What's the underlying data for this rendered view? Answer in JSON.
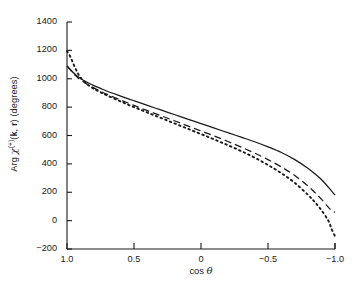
{
  "figure": {
    "background": "#ffffff",
    "ink_color": "#1a1a1a",
    "frame": {
      "left": 67,
      "top": 22,
      "right": 335,
      "bottom": 249
    }
  },
  "axes": {
    "ylabel_parts": {
      "arg": "Arg ",
      "chi": "χ",
      "superscript": "(+)",
      "args_open": "(",
      "k": "k",
      "comma": ", ",
      "r": "r",
      "args_close": ")",
      "units": " (degrees)"
    },
    "ylabel_plain": "Arg χ(+)(k, r) (degrees)",
    "xlabel_prefix": "cos ",
    "xlabel_symbol": "θ",
    "xlabel_plain": "cos θ"
  },
  "chart_data": {
    "type": "line",
    "title": "",
    "xlabel": "cos θ",
    "ylabel": "Arg χ(+)(k, r) (degrees)",
    "xlim": [
      1.0,
      -1.0
    ],
    "ylim": [
      -200,
      1400
    ],
    "x_reversed": true,
    "grid": false,
    "legend": "none",
    "xticks": [
      1.0,
      0.5,
      0,
      -0.5,
      -1.0
    ],
    "xticklabels": [
      "1.0",
      "0.5",
      "0",
      "−0.5",
      "−1.0"
    ],
    "yticks": [
      1400,
      1200,
      1000,
      800,
      600,
      400,
      200,
      0,
      -200
    ],
    "yticklabels": [
      "1400",
      "1200",
      "1000",
      "800",
      "600",
      "400",
      "200",
      "0",
      "−200"
    ],
    "tick_direction": "in",
    "x": [
      1.0,
      0.975,
      0.95,
      0.925,
      0.9,
      0.85,
      0.8,
      0.75,
      0.7,
      0.6,
      0.5,
      0.4,
      0.3,
      0.2,
      0.1,
      0.0,
      -0.1,
      -0.2,
      -0.3,
      -0.4,
      -0.5,
      -0.6,
      -0.7,
      -0.8,
      -0.85,
      -0.9,
      -0.95,
      -0.975,
      -1.0
    ],
    "series": [
      {
        "name": "solid",
        "style": "solid",
        "color": "#1a1a1a",
        "values": [
          1090,
          1065,
          1040,
          1020,
          1002,
          975,
          952,
          932,
          912,
          878,
          845,
          812,
          780,
          748,
          716,
          684,
          652,
          620,
          588,
          556,
          520,
          480,
          430,
          368,
          330,
          288,
          236,
          208,
          180
        ]
      },
      {
        "name": "dashed",
        "style": "dashed",
        "color": "#1a1a1a",
        "values": [
          1090,
          1062,
          1035,
          1012,
          992,
          962,
          936,
          912,
          890,
          850,
          812,
          775,
          740,
          704,
          668,
          632,
          596,
          558,
          518,
          476,
          430,
          378,
          318,
          242,
          198,
          150,
          95,
          72,
          58
        ]
      },
      {
        "name": "dotted",
        "style": "dotted",
        "color": "#1a1a1a",
        "values": [
          1195,
          1155,
          1100,
          1050,
          1010,
          962,
          930,
          905,
          882,
          840,
          800,
          762,
          724,
          686,
          648,
          610,
          572,
          532,
          490,
          444,
          392,
          334,
          266,
          180,
          130,
          72,
          0,
          -60,
          -110
        ]
      }
    ],
    "dotted_overshoot_note": "dotted series rises to ~1195 at cos θ = 1.0 before steep drop"
  }
}
